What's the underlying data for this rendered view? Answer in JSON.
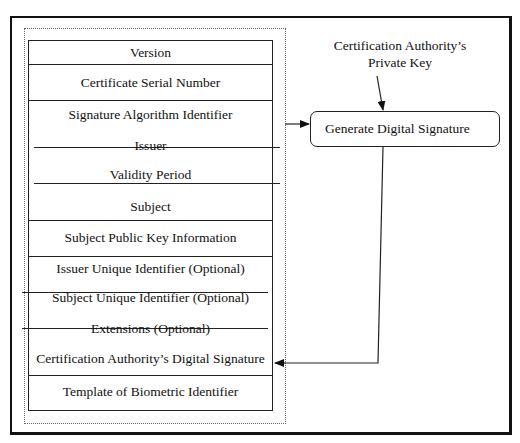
{
  "diagram": {
    "certificate_fields": [
      {
        "label": "Version"
      },
      {
        "label": "Certificate Serial Number"
      },
      {
        "label": "Signature Algorithm Identifier"
      },
      {
        "label": "Issuer"
      },
      {
        "label": "Validity Period"
      },
      {
        "label": "Subject"
      },
      {
        "label": "Subject Public Key Information"
      },
      {
        "label": "Issuer Unique Identifier (Optional)"
      },
      {
        "label": "Subject Unique Identifier (Optional)"
      },
      {
        "label": "Extensions (Optional)"
      },
      {
        "label": "Certification Authority’s Digital Signature"
      },
      {
        "label": "Template of Biometric Identifier"
      }
    ],
    "private_key_label": {
      "line1": "Certification Authority’s",
      "line2": "Private Key"
    },
    "process_box": {
      "label": "Generate Digital Signature"
    },
    "colors": {
      "line": "#222222",
      "background": "#ffffff"
    }
  }
}
